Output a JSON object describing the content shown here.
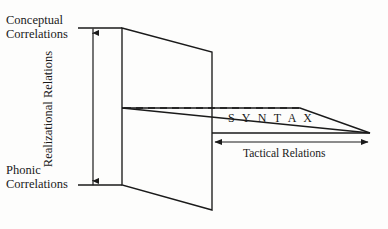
{
  "figure": {
    "type": "linguistic-stratification-diagram",
    "background_color": "#fdfdfc",
    "line_color": "#1a1a1a",
    "labels": {
      "conceptual_line1": "Conceptual",
      "conceptual_line2": "Correlations",
      "phonic_line1": "Phonic",
      "phonic_line2": "Correlations",
      "realizational": "Realizational Relations",
      "syntax": "S Y N T A X",
      "tactical": "Tactical Relations"
    },
    "axes": {
      "vertical_axis_name": "Realizational Relations",
      "vertical_axis_top_label": "Conceptual Correlations",
      "vertical_axis_bottom_label": "Phonic Correlations",
      "horizontal_axis_name": "Tactical Relations"
    },
    "planes": [
      {
        "name": "realizational-plane",
        "orientation": "vertical",
        "points": "122,28 212,52 212,210 122,185"
      },
      {
        "name": "tactical-plane",
        "orientation": "horizontal",
        "points": "122,108 300,108 370,133 212,133"
      }
    ]
  }
}
